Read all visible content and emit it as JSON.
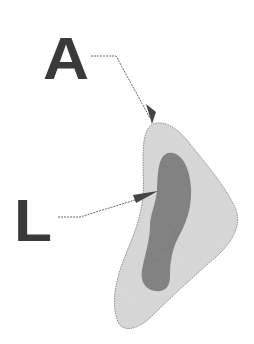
{
  "diagram": {
    "labels": [
      {
        "id": "A",
        "text": "A",
        "points_to": "outer-region"
      },
      {
        "id": "L",
        "text": "L",
        "points_to": "inner-region"
      }
    ],
    "colors": {
      "background": "#ffffff",
      "outer_fill": "#d8d8d8",
      "outer_stroke": "#8a8a8a",
      "inner_fill": "#7e7e7e",
      "label": "#3a3a3a",
      "leader": "#555555"
    }
  }
}
